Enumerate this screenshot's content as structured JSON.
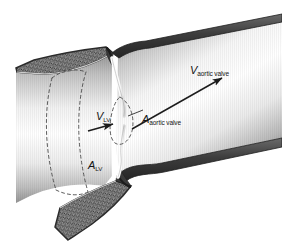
{
  "figure": {
    "width": 282,
    "height": 248,
    "background_color": "#ffffff"
  },
  "labels": {
    "v_aortic_valve": {
      "symbol": "V",
      "subscript": "aortic valve"
    },
    "a_aortic_valve": {
      "symbol": "A",
      "subscript": "aortic valve"
    },
    "v_lv": {
      "symbol": "V",
      "subscript": "LV"
    },
    "a_lv": {
      "symbol": "A",
      "subscript": "LV"
    }
  },
  "anatomy": {
    "myocardium_label": "myocardium",
    "lv_cavity_label": "left ventricular cavity",
    "aorta_label": "aorta",
    "valve_leaflet_label": "aortic valve leaflet"
  },
  "colors": {
    "wall_dark": "#4a4a4a",
    "wall_outline": "#2e2e2e",
    "myocardium_fill": "#8c8c8c",
    "lumen_light": "#fdfdfd",
    "lumen_shadow": "#9c9c9c",
    "leaflet": "#ffffff",
    "ink": "#141414",
    "dashed": "#4d4d4d"
  }
}
